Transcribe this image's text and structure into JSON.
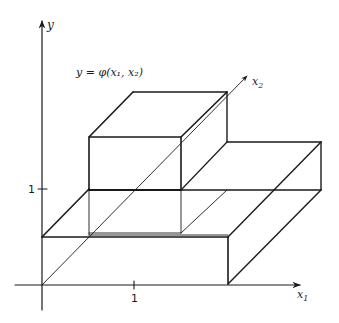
{
  "diagram": {
    "title_formula": "y = φ(x₁, x₂)",
    "axes": {
      "y_label": "y",
      "x1_label": "x",
      "x1_sub": "1",
      "x2_label": "x",
      "x2_sub": "2"
    },
    "ticks": {
      "y_tick_label": "1",
      "x1_tick_label": "1"
    },
    "colors": {
      "stroke": "#1a1a1a",
      "background": "#ffffff"
    }
  }
}
